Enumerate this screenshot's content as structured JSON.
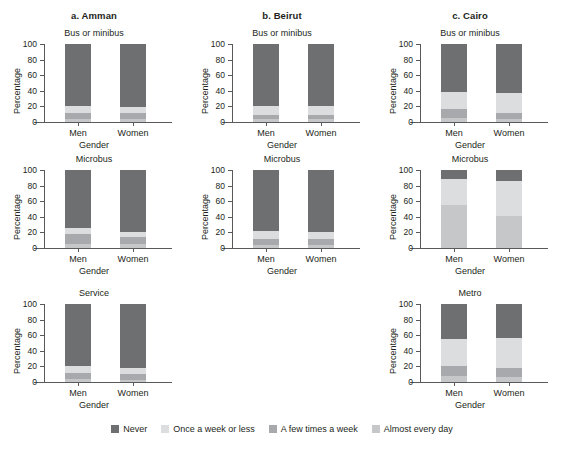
{
  "chart_data": {
    "type": "bar",
    "subtype": "stacked-100-percent",
    "title": "",
    "xlabel": "Gender",
    "ylabel": "Percentage",
    "ylim": [
      0,
      100
    ],
    "yticks": [
      0,
      20,
      40,
      60,
      80,
      100
    ],
    "categories": [
      "Men",
      "Women"
    ],
    "grid": false,
    "legend_position": "bottom",
    "legend": [
      {
        "name": "Never",
        "color": "#6e6f71"
      },
      {
        "name": "Once a week or less",
        "color": "#dcdddf"
      },
      {
        "name": "A few times a week",
        "color": "#a7a9ac"
      },
      {
        "name": "Almost every day",
        "color": "#c6c7c9"
      }
    ],
    "series_order": [
      "Almost every day",
      "A few times a week",
      "Once a week or less",
      "Never"
    ],
    "panels": [
      {
        "letter": "a. Amman",
        "mode": "Bus or minibus",
        "row": 1,
        "col": 1,
        "bars": [
          {
            "category": "Men",
            "values": {
              "Almost every day": 4,
              "A few times a week": 8,
              "Once a week or less": 9,
              "Never": 79
            }
          },
          {
            "category": "Women",
            "values": {
              "Almost every day": 4,
              "A few times a week": 7,
              "Once a week or less": 8,
              "Never": 81
            }
          }
        ]
      },
      {
        "letter": "b. Beirut",
        "mode": "Bus or minibus",
        "row": 1,
        "col": 2,
        "bars": [
          {
            "category": "Men",
            "values": {
              "Almost every day": 4,
              "A few times a week": 5,
              "Once a week or less": 12,
              "Never": 79
            }
          },
          {
            "category": "Women",
            "values": {
              "Almost every day": 4,
              "A few times a week": 5,
              "Once a week or less": 11,
              "Never": 80
            }
          }
        ]
      },
      {
        "letter": "c. Cairo",
        "mode": "Bus or minibus",
        "row": 1,
        "col": 3,
        "bars": [
          {
            "category": "Men",
            "values": {
              "Almost every day": 5,
              "A few times a week": 12,
              "Once a week or less": 21,
              "Never": 62
            }
          },
          {
            "category": "Women",
            "values": {
              "Almost every day": 4,
              "A few times a week": 8,
              "Once a week or less": 25,
              "Never": 63
            }
          }
        ]
      },
      {
        "letter": "",
        "mode": "Microbus",
        "row": 2,
        "col": 1,
        "bars": [
          {
            "category": "Men",
            "values": {
              "Almost every day": 5,
              "A few times a week": 13,
              "Once a week or less": 8,
              "Never": 74
            }
          },
          {
            "category": "Women",
            "values": {
              "Almost every day": 5,
              "A few times a week": 9,
              "Once a week or less": 7,
              "Never": 79
            }
          }
        ]
      },
      {
        "letter": "",
        "mode": "Microbus",
        "row": 2,
        "col": 2,
        "bars": [
          {
            "category": "Men",
            "values": {
              "Almost every day": 4,
              "A few times a week": 8,
              "Once a week or less": 10,
              "Never": 78
            }
          },
          {
            "category": "Women",
            "values": {
              "Almost every day": 4,
              "A few times a week": 7,
              "Once a week or less": 9,
              "Never": 80
            }
          }
        ]
      },
      {
        "letter": "",
        "mode": "Microbus",
        "row": 2,
        "col": 3,
        "bars": [
          {
            "category": "Men",
            "values": {
              "Almost every day": 55,
              "A few times a week": 0,
              "Once a week or less": 33,
              "Never": 12
            }
          },
          {
            "category": "Women",
            "values": {
              "Almost every day": 41,
              "A few times a week": 0,
              "Once a week or less": 45,
              "Never": 14
            }
          }
        ]
      },
      {
        "letter": "",
        "mode": "Service",
        "row": 3,
        "col": 1,
        "bars": [
          {
            "category": "Men",
            "values": {
              "Almost every day": 4,
              "A few times a week": 7,
              "Once a week or less": 9,
              "Never": 80
            }
          },
          {
            "category": "Women",
            "values": {
              "Almost every day": 3,
              "A few times a week": 7,
              "Once a week or less": 8,
              "Never": 82
            }
          }
        ]
      },
      {
        "letter": "",
        "mode": "",
        "row": 3,
        "col": 2,
        "bars": []
      },
      {
        "letter": "",
        "mode": "Metro",
        "row": 3,
        "col": 3,
        "bars": [
          {
            "category": "Men",
            "values": {
              "Almost every day": 8,
              "A few times a week": 12,
              "Once a week or less": 35,
              "Never": 45
            }
          },
          {
            "category": "Women",
            "values": {
              "Almost every day": 7,
              "A few times a week": 11,
              "Once a week or less": 39,
              "Never": 43
            }
          }
        ]
      }
    ]
  }
}
